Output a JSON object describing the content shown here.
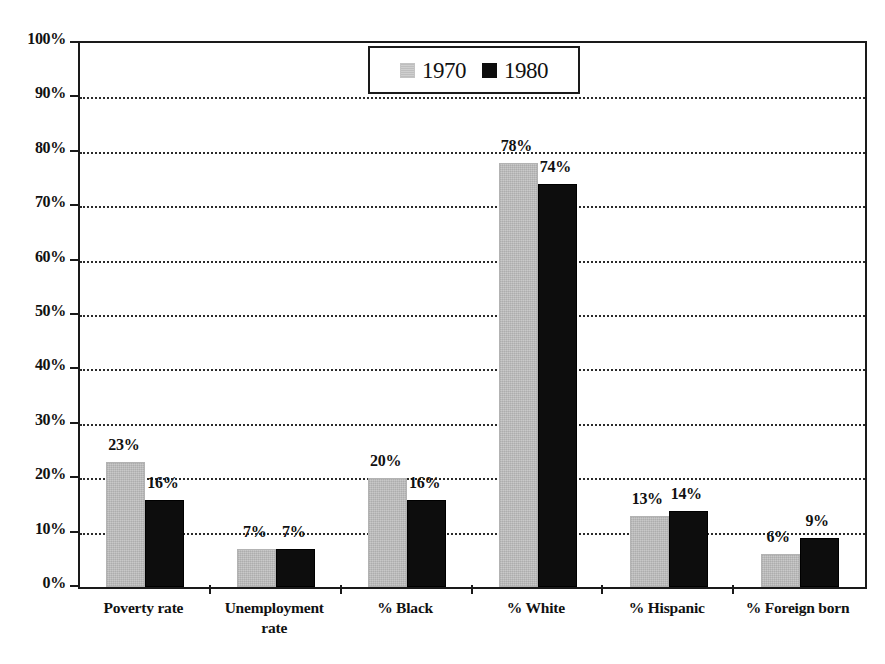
{
  "chart_data": {
    "type": "bar",
    "title": "",
    "subtitle": "",
    "xlabel": "",
    "ylabel": "",
    "ylim": [
      0,
      100
    ],
    "ytick_labels": [
      "0%",
      "10%",
      "20%",
      "30%",
      "40%",
      "50%",
      "60%",
      "70%",
      "80%",
      "90%",
      "100%"
    ],
    "ytick_values": [
      0,
      10,
      20,
      30,
      40,
      50,
      60,
      70,
      80,
      90,
      100
    ],
    "grid": true,
    "grid_axis": "y",
    "legend_position": "top-center",
    "categories": [
      "Poverty rate",
      "Unemployment rate",
      "% Black",
      "% White",
      "% Hispanic",
      "% Foreign born"
    ],
    "category_lines": [
      [
        "Poverty rate"
      ],
      [
        "Unemployment",
        "rate"
      ],
      [
        "% Black"
      ],
      [
        "% White"
      ],
      [
        "% Hispanic"
      ],
      [
        "% Foreign born"
      ]
    ],
    "series": [
      {
        "name": "1970",
        "color": "#c2c2c2",
        "values": [
          23,
          7,
          20,
          78,
          13,
          6
        ],
        "labels": [
          "23%",
          "7%",
          "20%",
          "78%",
          "13%",
          "6%"
        ]
      },
      {
        "name": "1980",
        "color": "#0d0d0d",
        "values": [
          16,
          7,
          16,
          74,
          14,
          9
        ],
        "labels": [
          "16%",
          "7%",
          "16%",
          "74%",
          "14%",
          "9%"
        ]
      }
    ]
  },
  "legend": {
    "entries": [
      {
        "label": "1970",
        "swatch": "gray-swatch"
      },
      {
        "label": "1980",
        "swatch": "black-swatch"
      }
    ]
  },
  "colors": {
    "series_1970": "#c2c2c2",
    "series_1980": "#0d0d0d",
    "axis": "#1a1a1a",
    "grid": "#2b2b2b",
    "text": "#111111",
    "background": "#ffffff"
  }
}
